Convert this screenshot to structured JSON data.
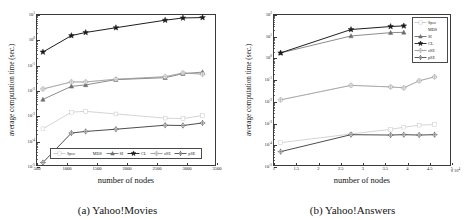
{
  "figure": {
    "panels": [
      {
        "id": "panel-a",
        "caption": "(a) Yahoo!Movies",
        "xlabel": "number of nodes",
        "ylabel": "average computation time (sec.)"
      },
      {
        "id": "panel-b",
        "caption": "(b) Yahoo!Answers",
        "xlabel": "number of nodes",
        "ylabel": "average computation time (sec.)"
      }
    ]
  },
  "series_style": {
    "Spec": {
      "color": "#c8c8c8",
      "marker": "square"
    },
    "MDS": {
      "color": "#d8d8d8",
      "marker": "none"
    },
    "SI": {
      "color": "#6e6e6e",
      "marker": "triangle"
    },
    "CL": {
      "color": "#1a1a1a",
      "marker": "star"
    },
    "zSE": {
      "color": "#9a9a9a",
      "marker": "circle-plus"
    },
    "pSE": {
      "color": "#4a4a4a",
      "marker": "diamond-plus"
    }
  },
  "chart_data": [
    {
      "type": "line",
      "title": "(a) Yahoo!Movies",
      "xlabel": "number of nodes",
      "ylabel": "average computation time (sec.)",
      "yscale": "log",
      "xlim": [
        500,
        3500
      ],
      "ylim": [
        1e-05,
        10
      ],
      "grid": false,
      "legend_position": "bottom-inside",
      "xticks": [
        "500",
        "1000",
        "1500",
        "2000",
        "2500",
        "3000",
        "3500"
      ],
      "xtick_values": [
        500,
        1000,
        1500,
        2000,
        2500,
        3000,
        3500
      ],
      "yticks": [
        "10^-5",
        "10^-4",
        "10^-3",
        "10^-2",
        "10^-1",
        "10^0",
        "10^1"
      ],
      "ytick_values": [
        1e-05,
        0.0001,
        0.001,
        0.01,
        0.1,
        1,
        10
      ],
      "x": [
        600,
        1080,
        1320,
        1830,
        2660,
        2960,
        3290
      ],
      "series": [
        {
          "name": "Spec",
          "values": [
            0.00028,
            0.0013,
            0.0014,
            0.0011,
            0.00075,
            0.00072,
            0.00095
          ]
        },
        {
          "name": "MDS",
          "values": [
            0.011,
            0.021,
            0.021,
            0.027,
            0.034,
            0.048,
            0.043
          ]
        },
        {
          "name": "SI",
          "values": [
            0.0042,
            0.014,
            0.016,
            0.026,
            0.031,
            0.045,
            0.052
          ]
        },
        {
          "name": "CL",
          "values": [
            0.33,
            1.5,
            2.0,
            3.1,
            6.2,
            7.6,
            7.9
          ]
        },
        {
          "name": "zSE",
          "values": [
            0.011,
            0.021,
            0.021,
            0.027,
            0.034,
            0.048,
            0.043
          ]
        },
        {
          "name": "pSE",
          "values": [
            1.25e-05,
            0.00019,
            0.00022,
            0.00027,
            0.00039,
            0.00038,
            0.00048
          ]
        }
      ]
    },
    {
      "type": "line",
      "title": "(b) Yahoo!Answers",
      "xlabel": "number of nodes",
      "ylabel": "average computation time (sec.)",
      "yscale": "log",
      "x_multiplier": "x 10^4",
      "xlim": [
        10000,
        50000
      ],
      "ylim": [
        1e-05,
        100
      ],
      "grid": false,
      "legend_position": "top-right",
      "xticks": [
        "1",
        "1.5",
        "2",
        "2.5",
        "3",
        "3.5",
        "4",
        "4.5",
        "5"
      ],
      "xtick_values": [
        10000,
        15000,
        20000,
        25000,
        30000,
        35000,
        40000,
        45000,
        50000
      ],
      "yticks": [
        "10^-5",
        "10^-4",
        "10^-3",
        "10^-2",
        "10^-1",
        "10^0",
        "10^1",
        "10^2"
      ],
      "ytick_values": [
        1e-05,
        0.0001,
        0.001,
        0.01,
        0.1,
        1,
        10,
        100
      ],
      "x": [
        11500,
        27500,
        36500,
        39500,
        43000,
        46500
      ],
      "series": [
        {
          "name": "Spec",
          "values": [
            0.00011,
            0.00028,
            0.00046,
            0.00058,
            0.00072,
            0.00078
          ]
        },
        {
          "name": "MDS",
          "values": [
            0.011,
            0.052,
            0.044,
            0.04,
            0.085,
            0.13
          ]
        },
        {
          "name": "SI",
          "values": [
            1.7,
            10.5,
            15.0,
            15.5,
            null,
            null
          ]
        },
        {
          "name": "CL",
          "values": [
            1.7,
            21.0,
            29.0,
            31.0,
            null,
            null
          ]
        },
        {
          "name": "zSE",
          "values": [
            0.011,
            0.052,
            0.044,
            0.04,
            0.085,
            0.13
          ]
        },
        {
          "name": "pSE",
          "values": [
            4.2e-05,
            0.00026,
            0.00025,
            0.00026,
            0.00025,
            0.00026
          ]
        }
      ]
    }
  ],
  "legend": {
    "entries": [
      {
        "label": "Spec"
      },
      {
        "label": "MDS"
      },
      {
        "label": "SI"
      },
      {
        "label": "CL"
      },
      {
        "label": "zSE"
      },
      {
        "label": "pSE"
      }
    ]
  }
}
